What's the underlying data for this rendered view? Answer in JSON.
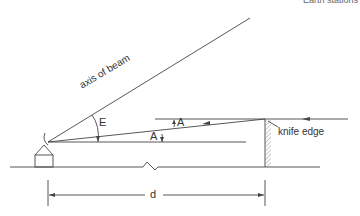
{
  "header": {
    "partial_title": "Earth stations"
  },
  "diagram": {
    "labels": {
      "axis_of_beam": "axis of beam",
      "elevation_angle": "E",
      "angle_a_lower": "A",
      "angle_a_upper": "A",
      "knife_edge": "knife edge",
      "distance": "d"
    },
    "colors": {
      "line": "#444444",
      "hatch": "#777777"
    }
  }
}
